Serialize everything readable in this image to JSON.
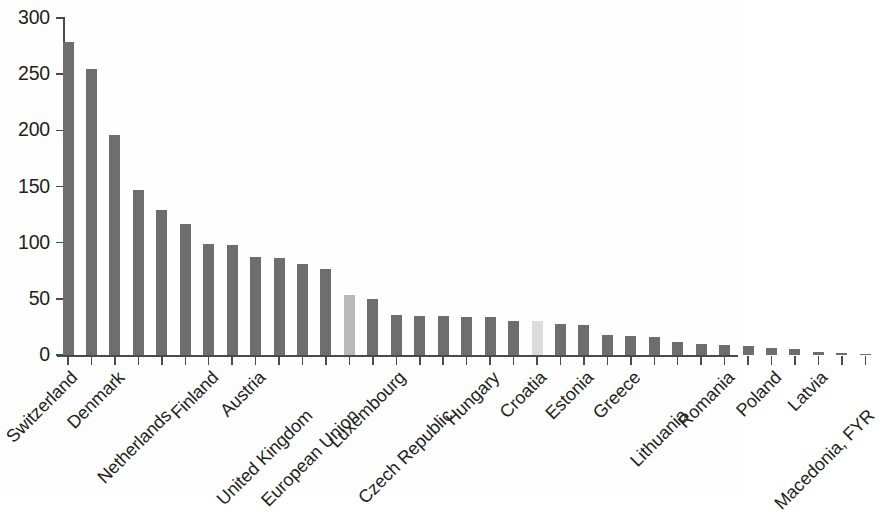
{
  "chart_data": {
    "type": "bar",
    "title": "",
    "subtitle": "",
    "xlabel": "",
    "ylabel": "",
    "ylim": [
      0,
      300
    ],
    "yticks": [
      0,
      50,
      100,
      150,
      200,
      250,
      300
    ],
    "ytick_labels": [
      "0",
      "50",
      "100",
      "150",
      "200",
      "250",
      "300"
    ],
    "grid": false,
    "legend": null,
    "legend_position": "none",
    "bar_color": "#6e6e6e",
    "highlight_color": "#b9b9b9",
    "highlight2_color": "#dcdcdc",
    "categories": [
      "Switzerland",
      "Norway",
      "Denmark",
      "Sweden",
      "Netherlands",
      "Germany",
      "Finland",
      "Belgium",
      "Austria",
      "France",
      "United Kingdom",
      "Ireland",
      "European Union",
      "Italy",
      "Luxembourg",
      "Spain",
      "Czech Republic",
      "Slovenia",
      "Hungary",
      "Portugal",
      "Croatia",
      "Slovakia",
      "Estonia",
      "Bulgaria",
      "Greece",
      "Cyprus",
      "Lithuania",
      "Malta",
      "Romania",
      "Turkey",
      "Poland",
      "Serbia",
      "Latvia",
      "Iceland",
      "Macedonia, FYR"
    ],
    "values": [
      279,
      255,
      196,
      147,
      129,
      117,
      99,
      98,
      87,
      86,
      81,
      77,
      53,
      50,
      36,
      35,
      35,
      34,
      34,
      30,
      30,
      28,
      27,
      18,
      17,
      16,
      12,
      10,
      9,
      8,
      6,
      5,
      3,
      2,
      1
    ],
    "bar_shades": [
      "dark",
      "dark",
      "dark",
      "dark",
      "dark",
      "dark",
      "dark",
      "dark",
      "dark",
      "dark",
      "dark",
      "dark",
      "light",
      "dark",
      "dark",
      "dark",
      "dark",
      "dark",
      "dark",
      "dark",
      "lighter",
      "dark",
      "dark",
      "dark",
      "dark",
      "dark",
      "dark",
      "dark",
      "dark",
      "dark",
      "dark",
      "dark",
      "dark",
      "dark",
      "dark"
    ],
    "visible_tick_labels": [
      {
        "index": 0,
        "label": "Switzerland",
        "row": 0
      },
      {
        "index": 2,
        "label": "Denmark",
        "row": 0
      },
      {
        "index": 4,
        "label": "Netherlands",
        "row": 1
      },
      {
        "index": 6,
        "label": "Finland",
        "row": 0
      },
      {
        "index": 8,
        "label": "Austria",
        "row": 0
      },
      {
        "index": 10,
        "label": "United Kingdom",
        "row": 1
      },
      {
        "index": 12,
        "label": "European Union",
        "row": 1
      },
      {
        "index": 14,
        "label": "Luxembourg",
        "row": 0
      },
      {
        "index": 16,
        "label": "Czech Republic",
        "row": 1
      },
      {
        "index": 18,
        "label": "Hungary",
        "row": 0
      },
      {
        "index": 20,
        "label": "Croatia",
        "row": 0
      },
      {
        "index": 22,
        "label": "Estonia",
        "row": 0
      },
      {
        "index": 24,
        "label": "Greece",
        "row": 0
      },
      {
        "index": 26,
        "label": "Lithuania",
        "row": 1
      },
      {
        "index": 28,
        "label": "Romania",
        "row": 0
      },
      {
        "index": 30,
        "label": "Poland",
        "row": 0
      },
      {
        "index": 32,
        "label": "Latvia",
        "row": 0
      },
      {
        "index": 34,
        "label": "Macedonia, FYR",
        "row": 1
      }
    ]
  }
}
